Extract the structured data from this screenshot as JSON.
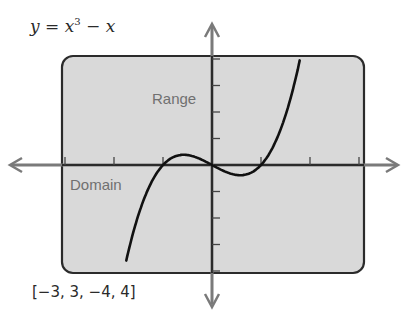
{
  "chart_data": {
    "type": "line",
    "equation": {
      "prefix": "y = x",
      "exponent": "3",
      "suffix": " − x"
    },
    "x_range": [
      -3,
      3
    ],
    "y_range": [
      -4,
      4
    ],
    "window_label": "[−3, 3, −4, 4]",
    "xlabel": "Domain",
    "ylabel": "Range",
    "x_ticks": [
      -3,
      -2,
      -1,
      0,
      1,
      2,
      3
    ],
    "y_ticks": [
      -4,
      -3,
      -2,
      -1,
      0,
      1,
      2,
      3,
      4
    ],
    "grid": false,
    "series": [
      {
        "name": "y = x^3 - x",
        "x": [
          -1.75,
          -1.5,
          -1.25,
          -1,
          -0.75,
          -0.577,
          -0.25,
          0,
          0.25,
          0.577,
          0.75,
          1,
          1.25,
          1.5,
          1.8
        ],
        "y": [
          -3.61,
          -1.88,
          -0.7,
          0,
          0.33,
          0.385,
          0.23,
          0,
          -0.23,
          -0.385,
          -0.33,
          0,
          0.7,
          1.88,
          4.03
        ]
      }
    ],
    "colors": {
      "screen": "#d9d9d9",
      "border": "#2b2b2b",
      "axis": "#7a7a7a",
      "curve": "#111111"
    }
  }
}
